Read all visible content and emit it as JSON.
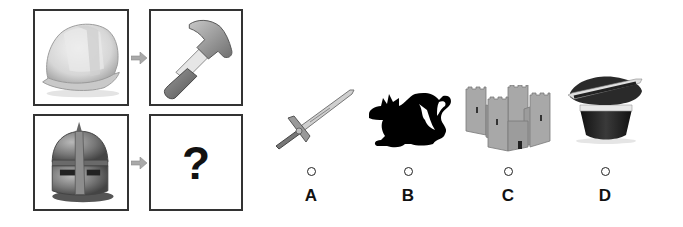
{
  "puzzle": {
    "premise_row": {
      "source": {
        "icon": "hard-hat-icon",
        "description": "construction hard hat"
      },
      "target": {
        "icon": "hammer-icon",
        "description": "hammer"
      }
    },
    "question_row": {
      "source": {
        "icon": "knight-helmet-icon",
        "description": "medieval knight helmet"
      },
      "target": {
        "text": "?"
      }
    },
    "arrow_glyph": "arrow-right"
  },
  "options": [
    {
      "label": "A",
      "icon": "sword-icon",
      "description": "sword"
    },
    {
      "label": "B",
      "icon": "dragon-icon",
      "description": "dragon silhouette"
    },
    {
      "label": "C",
      "icon": "castle-icon",
      "description": "castle"
    },
    {
      "label": "D",
      "icon": "top-hat-icon",
      "description": "magician top hat with wand"
    }
  ],
  "colors": {
    "border": "#333333",
    "arrow": "#a9a9a9",
    "text": "#111111"
  }
}
